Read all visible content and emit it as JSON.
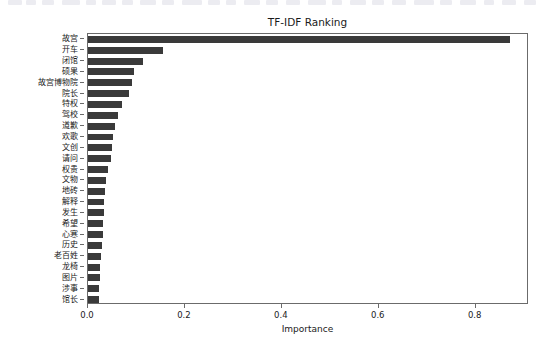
{
  "top_strip": {
    "note": "clipped partial toolbar row at top edge",
    "chips": [
      {
        "x": 8,
        "w": 14
      },
      {
        "x": 26,
        "w": 10
      },
      {
        "x": 42,
        "w": 12
      },
      {
        "x": 62,
        "w": 18
      },
      {
        "x": 86,
        "w": 10
      },
      {
        "x": 102,
        "w": 14
      },
      {
        "x": 122,
        "w": 11
      },
      {
        "x": 140,
        "w": 16
      },
      {
        "x": 162,
        "w": 12
      },
      {
        "x": 182,
        "w": 20
      },
      {
        "x": 208,
        "w": 12
      },
      {
        "x": 226,
        "w": 10
      },
      {
        "x": 244,
        "w": 16
      },
      {
        "x": 266,
        "w": 12
      },
      {
        "x": 286,
        "w": 14
      },
      {
        "x": 308,
        "w": 18
      },
      {
        "x": 332,
        "w": 10
      },
      {
        "x": 350,
        "w": 16
      },
      {
        "x": 372,
        "w": 12
      },
      {
        "x": 392,
        "w": 14
      },
      {
        "x": 414,
        "w": 20
      },
      {
        "x": 440,
        "w": 12
      },
      {
        "x": 460,
        "w": 16
      },
      {
        "x": 484,
        "w": 10
      },
      {
        "x": 502,
        "w": 14
      },
      {
        "x": 524,
        "w": 12
      }
    ]
  },
  "figure": {
    "background": "#ffffff",
    "bar_color": "#3a3a3a",
    "axis_color": "#6b6b6b"
  },
  "chart_data": {
    "type": "bar",
    "orientation": "horizontal",
    "title": "TF-IDF Ranking",
    "xlabel": "Importance",
    "ylabel": "",
    "grid": false,
    "legend": false,
    "xlim": [
      0.0,
      0.91
    ],
    "xticks": [
      0.0,
      0.2,
      0.4,
      0.6,
      0.8
    ],
    "xticklabels": [
      "0.0",
      "0.2",
      "0.4",
      "0.6",
      "0.8"
    ],
    "categories": [
      "故宫",
      "开车",
      "闭馆",
      "硕果",
      "故宫博物院",
      "院长",
      "特权",
      "驾校",
      "道歉",
      "欢歌",
      "文创",
      "请问",
      "权贵",
      "文物",
      "地砖",
      "解释",
      "发生",
      "希望",
      "心寒",
      "历史",
      "老百姓",
      "龙椅",
      "图片",
      "涉事",
      "馆长"
    ],
    "values": [
      0.87,
      0.155,
      0.113,
      0.095,
      0.09,
      0.085,
      0.07,
      0.062,
      0.055,
      0.052,
      0.05,
      0.048,
      0.042,
      0.037,
      0.035,
      0.033,
      0.032,
      0.031,
      0.03,
      0.029,
      0.026,
      0.025,
      0.024,
      0.023,
      0.022
    ]
  }
}
